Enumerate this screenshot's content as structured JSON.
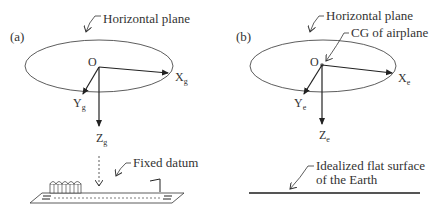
{
  "panel_a": {
    "tag": "(a)",
    "plane_label": "Horizontal plane",
    "origin": "O",
    "x_axis": {
      "base": "X",
      "sub": "g"
    },
    "y_axis": {
      "base": "Y",
      "sub": "g"
    },
    "z_axis": {
      "base": "Z",
      "sub": "g"
    },
    "datum_label": "Fixed datum"
  },
  "panel_b": {
    "tag": "(b)",
    "plane_label": "Horizontal plane",
    "cg_label": "CG of airplane",
    "origin": "O",
    "x_axis": {
      "base": "X",
      "sub": "e"
    },
    "y_axis": {
      "base": "Y",
      "sub": "e"
    },
    "z_axis": {
      "base": "Z",
      "sub": "e"
    },
    "earth_label_line1": "Idealized flat surface",
    "earth_label_line2": "of the Earth"
  },
  "colors": {
    "stroke": "#333333",
    "ground": "#555555"
  }
}
